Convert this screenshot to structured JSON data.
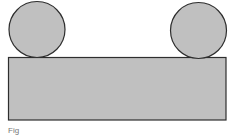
{
  "diagram": {
    "colors": {
      "fill": "#c0c0c0",
      "stroke": "#2e2e2e",
      "background": "#ffffff"
    },
    "shapes": {
      "left_circle": {
        "cx": 37,
        "cy": 29.5,
        "r": 28
      },
      "right_circle": {
        "cx": 198.5,
        "cy": 30.5,
        "r": 28
      },
      "block": {
        "x": 8.5,
        "y": 57.5,
        "width": 217.5,
        "height": 62.5
      }
    }
  },
  "caption": {
    "text": "Fig"
  }
}
